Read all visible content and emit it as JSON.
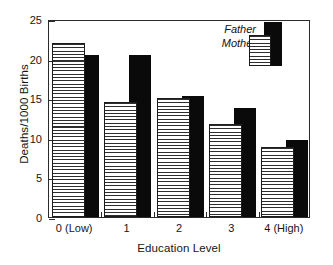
{
  "chart_data": {
    "type": "bar",
    "title": "",
    "xlabel": "Education Level",
    "ylabel": "Deaths/1000 Births",
    "categories": [
      "0 (Low)",
      "1",
      "2",
      "3",
      "4 (High)"
    ],
    "series": [
      {
        "name": "Mother",
        "style": "horizontal-stripes",
        "values": [
          22.0,
          14.5,
          15.0,
          11.8,
          8.8
        ]
      },
      {
        "name": "Father",
        "style": "solid-black",
        "values": [
          20.5,
          20.5,
          15.3,
          13.8,
          9.7
        ]
      }
    ],
    "ylim": [
      0,
      25
    ],
    "yticks": [
      0,
      5,
      10,
      15,
      20,
      25
    ],
    "ytick_labels": [
      "0",
      "5",
      "10",
      "15",
      "20",
      "25"
    ],
    "grid": false,
    "legend_position": "top-right",
    "legend_entries": [
      "Father",
      "Mother"
    ],
    "colors": {
      "father": "#0a0a0a",
      "mother_stripe": "#2e2e2e",
      "mother_background": "#ffffff",
      "axis": "#2b2b2b",
      "text": "#161616",
      "background": "#ffffff"
    }
  },
  "legend": {
    "father_label": "Father",
    "mother_label": "Mother"
  }
}
